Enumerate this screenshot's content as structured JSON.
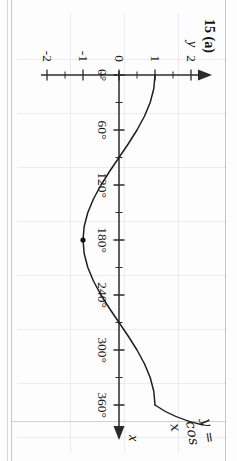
{
  "page": {
    "question_number": "15 (a)",
    "y_axis_name": "y",
    "x_axis_name": "x",
    "curve_label": "y = cos x"
  },
  "chart_data": {
    "type": "line",
    "title": "15 (a)",
    "xlabel": "x",
    "ylabel": "y",
    "annotations": [
      "y = cos x"
    ],
    "grid": true,
    "legend": "none",
    "xlim": [
      0,
      360
    ],
    "ylim": [
      -2,
      2
    ],
    "x_tick_labels": [
      "0°",
      "60°",
      "120°",
      "180°",
      "240°",
      "300°",
      "360°"
    ],
    "x_ticks": [
      0,
      60,
      120,
      180,
      240,
      300,
      360
    ],
    "x_minor_tick_step": 30,
    "y_tick_labels": [
      "2",
      "1",
      "0",
      "-1",
      "-2"
    ],
    "y_ticks": [
      2,
      1,
      0,
      -1,
      -2
    ],
    "y_minor_tick_step": 0.5,
    "series": [
      {
        "name": "y = cos x",
        "x": [
          0,
          15,
          30,
          45,
          60,
          75,
          90,
          105,
          120,
          135,
          150,
          165,
          180,
          195,
          210,
          225,
          240,
          255,
          270,
          285,
          300,
          315,
          330,
          345,
          360
        ],
        "values": [
          1,
          0.966,
          0.866,
          0.707,
          0.5,
          0.259,
          0,
          -0.259,
          -0.5,
          -0.707,
          -0.866,
          -0.966,
          -1,
          -0.966,
          -0.866,
          -0.707,
          -0.5,
          -0.259,
          0,
          0.259,
          0.5,
          0.707,
          0.866,
          0.966,
          1
        ]
      }
    ],
    "markers": [
      {
        "x": 180,
        "y": -1,
        "label": ""
      }
    ]
  }
}
